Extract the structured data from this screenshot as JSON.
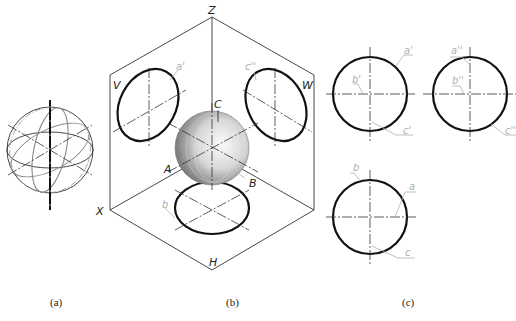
{
  "figure": {
    "type": "technical-drawing",
    "panels": [
      {
        "id": "a",
        "caption": "(a)",
        "description": "sphere with great circles (wireframe)"
      },
      {
        "id": "b",
        "caption": "(b)",
        "description": "sphere in three-plane projection system"
      },
      {
        "id": "c",
        "caption": "(c)",
        "description": "orthographic three views of the sphere"
      }
    ]
  },
  "panel_b": {
    "axis_labels": {
      "z": "Z",
      "x": "X",
      "h": "H"
    },
    "plane_labels": {
      "v": "V",
      "w": "W"
    },
    "point_labels": {
      "a": "A",
      "b": "B",
      "c": "C"
    },
    "projection_labels": {
      "a_front": "a'",
      "c_side": "c''",
      "b_top": "b"
    }
  },
  "panel_c": {
    "front_view": {
      "a": "a'",
      "b": "b'",
      "c": "c'"
    },
    "side_view": {
      "a": "a''",
      "b": "b''",
      "c": "c''"
    },
    "top_view": {
      "a": "a",
      "b": "b",
      "c": "c"
    }
  },
  "captions": {
    "a": "(a)",
    "b": "(b)",
    "c": "(c)"
  },
  "colors": {
    "stroke": "#111111",
    "thin": "#333333",
    "leader": "#b0b0b0",
    "sphere_light": "#f4f4f4",
    "sphere_dark": "#8a8a8a"
  }
}
